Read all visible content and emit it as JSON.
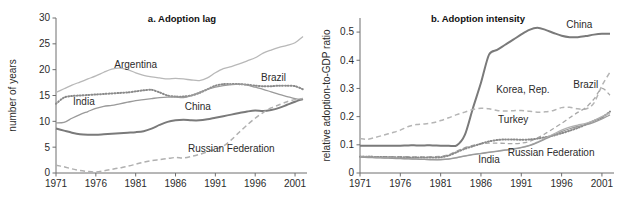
{
  "figure": {
    "width": 636,
    "height": 202,
    "background": "#ffffff"
  },
  "panel_a": {
    "title": "a. Adoption lag",
    "ylabel": "number of years"
  },
  "panel_b": {
    "title": "b. Adoption intensity",
    "ylabel": "relative adoption-to-GDP ratio"
  },
  "colors": {
    "china": "#7a7a7a",
    "argentina": "#b8b8b8",
    "brazil": "#9a9a9a",
    "india": "#8a8a8a",
    "russian_federation": "#b0b0b0",
    "korea_rep": "#b5b5b5",
    "turkey": "#a8a8a8",
    "axis": "#6e6e6e",
    "text": "#2b2b2b"
  },
  "chart_data": [
    {
      "id": "panel-a",
      "type": "line",
      "title": "a. Adoption lag",
      "xlabel": "",
      "ylabel": "number of years",
      "xlim": [
        1971,
        2002
      ],
      "ylim": [
        0,
        30
      ],
      "xticks": [
        1971,
        1976,
        1981,
        1986,
        1991,
        1996,
        2001
      ],
      "yticks": [
        0,
        5,
        10,
        15,
        20,
        25,
        30
      ],
      "grid": false,
      "legend": "inline-annotations",
      "x": [
        1971,
        1972,
        1973,
        1974,
        1975,
        1976,
        1977,
        1978,
        1979,
        1980,
        1981,
        1982,
        1983,
        1984,
        1985,
        1986,
        1987,
        1988,
        1989,
        1990,
        1991,
        1992,
        1993,
        1994,
        1995,
        1996,
        1997,
        1998,
        1999,
        2000,
        2001,
        2002
      ],
      "series": [
        {
          "name": "Argentina",
          "style": "solid",
          "color": "#b8b8b8",
          "label_x": 1981,
          "label_y": 20.3,
          "values": [
            15.6,
            16.3,
            17.0,
            17.6,
            18.2,
            18.8,
            19.5,
            20.1,
            20.3,
            20.0,
            19.4,
            18.9,
            18.6,
            18.4,
            18.2,
            18.3,
            18.2,
            18.0,
            17.9,
            18.4,
            19.4,
            20.2,
            20.6,
            21.1,
            21.7,
            22.3,
            23.2,
            23.8,
            24.3,
            24.7,
            25.2,
            26.4
          ]
        },
        {
          "name": "India",
          "style": "dotted",
          "color": "#8a8a8a",
          "label_x": 1974.5,
          "label_y": 13.1,
          "values": [
            13.4,
            14.6,
            14.9,
            15.0,
            15.1,
            15.2,
            15.3,
            15.4,
            15.5,
            15.6,
            15.8,
            16.0,
            16.1,
            15.6,
            15.0,
            14.8,
            14.8,
            15.0,
            15.5,
            16.2,
            16.9,
            17.2,
            17.2,
            17.2,
            17.1,
            16.9,
            16.8,
            16.8,
            16.9,
            16.9,
            16.8,
            16.2
          ]
        },
        {
          "name": "Brazil",
          "style": "solid",
          "color": "#9a9a9a",
          "label_x": 1998.3,
          "label_y": 17.8,
          "values": [
            9.7,
            9.8,
            10.6,
            11.3,
            11.9,
            12.5,
            12.9,
            13.1,
            13.4,
            13.7,
            14.0,
            14.2,
            14.4,
            14.6,
            14.7,
            14.7,
            14.6,
            15.0,
            15.6,
            16.2,
            16.6,
            16.9,
            17.1,
            17.2,
            17.0,
            16.6,
            16.2,
            15.7,
            15.2,
            14.8,
            14.4,
            14.2
          ]
        },
        {
          "name": "China",
          "style": "solid-thick",
          "color": "#7a7a7a",
          "label_x": 1988.8,
          "label_y": 12.2,
          "values": [
            8.6,
            8.2,
            7.8,
            7.5,
            7.4,
            7.4,
            7.5,
            7.6,
            7.7,
            7.8,
            7.9,
            8.1,
            8.6,
            9.3,
            9.9,
            10.2,
            10.3,
            10.2,
            10.2,
            10.4,
            10.7,
            11.0,
            11.3,
            11.6,
            11.9,
            12.1,
            12.0,
            12.2,
            12.6,
            13.2,
            13.8,
            14.3
          ]
        },
        {
          "name": "Russian Federation",
          "style": "dashed",
          "color": "#b0b0b0",
          "label_x": 1993.0,
          "label_y": 4.1,
          "values": [
            1.5,
            1.2,
            0.8,
            0.5,
            0.3,
            0.2,
            0.4,
            0.7,
            1.0,
            1.3,
            1.7,
            2.1,
            2.4,
            2.6,
            2.8,
            3.0,
            2.9,
            3.2,
            3.6,
            4.1,
            4.6,
            5.2,
            6.4,
            7.9,
            9.3,
            10.6,
            11.7,
            12.6,
            13.2,
            13.8,
            14.2,
            14.4
          ]
        }
      ]
    },
    {
      "id": "panel-b",
      "type": "line",
      "title": "b. Adoption intensity",
      "xlabel": "",
      "ylabel": "relative adoption-to-GDP ratio",
      "xlim": [
        1971,
        2002
      ],
      "ylim": [
        0,
        0.55
      ],
      "xticks": [
        1971,
        1976,
        1981,
        1986,
        1991,
        1996,
        2001
      ],
      "yticks": [
        0,
        0.1,
        0.2,
        0.3,
        0.4,
        0.5
      ],
      "ytick_labels": [
        "0",
        "0.1",
        "0.2",
        "0.3",
        "0.4",
        "0.5"
      ],
      "grid": false,
      "legend": "inline-annotations",
      "x": [
        1971,
        1972,
        1973,
        1974,
        1975,
        1976,
        1977,
        1978,
        1979,
        1980,
        1981,
        1982,
        1983,
        1984,
        1985,
        1986,
        1987,
        1988,
        1989,
        1990,
        1991,
        1992,
        1993,
        1994,
        1995,
        1996,
        1997,
        1998,
        1999,
        2000,
        2001,
        2002
      ],
      "series": [
        {
          "name": "China",
          "style": "solid-thick",
          "color": "#7a7a7a",
          "label_x": 1998.2,
          "label_y": 0.515,
          "values": [
            0.097,
            0.097,
            0.097,
            0.097,
            0.097,
            0.097,
            0.098,
            0.098,
            0.098,
            0.098,
            0.097,
            0.097,
            0.098,
            0.135,
            0.23,
            0.32,
            0.42,
            0.437,
            0.455,
            0.473,
            0.492,
            0.508,
            0.515,
            0.508,
            0.497,
            0.487,
            0.482,
            0.482,
            0.486,
            0.491,
            0.494,
            0.494
          ]
        },
        {
          "name": "Korea, Rep.",
          "style": "dashed",
          "color": "#b5b5b5",
          "label_x": 1991.2,
          "label_y": 0.283,
          "values": [
            0.122,
            0.12,
            0.127,
            0.135,
            0.143,
            0.152,
            0.165,
            0.172,
            0.174,
            0.178,
            0.186,
            0.196,
            0.207,
            0.216,
            0.225,
            0.23,
            0.228,
            0.222,
            0.22,
            0.221,
            0.222,
            0.219,
            0.216,
            0.217,
            0.222,
            0.232,
            0.233,
            0.228,
            0.227,
            0.248,
            0.31,
            0.358
          ]
        },
        {
          "name": "Turkey",
          "style": "dashed-light",
          "color": "#a8a8a8",
          "label_x": 1990.0,
          "label_y": 0.176,
          "values": [
            0.059,
            0.059,
            0.058,
            0.058,
            0.058,
            0.058,
            0.058,
            0.057,
            0.057,
            0.058,
            0.059,
            0.065,
            0.078,
            0.09,
            0.098,
            0.103,
            0.106,
            0.106,
            0.105,
            0.104,
            0.106,
            0.112,
            0.124,
            0.14,
            0.158,
            0.176,
            0.196,
            0.215,
            0.232,
            0.262,
            0.3,
            0.276
          ]
        },
        {
          "name": "India",
          "style": "dotted",
          "color": "#8a8a8a",
          "label_x": 1987.0,
          "label_y": 0.037,
          "values": [
            0.058,
            0.058,
            0.057,
            0.057,
            0.056,
            0.056,
            0.055,
            0.055,
            0.055,
            0.055,
            0.056,
            0.062,
            0.074,
            0.086,
            0.095,
            0.104,
            0.112,
            0.117,
            0.119,
            0.119,
            0.118,
            0.119,
            0.122,
            0.127,
            0.133,
            0.141,
            0.15,
            0.16,
            0.172,
            0.185,
            0.197,
            0.218
          ]
        },
        {
          "name": "Russian Federation",
          "style": "solid",
          "color": "#b0b0b0",
          "label_x": 1994.7,
          "label_y": 0.06,
          "values": [
            0.057,
            0.056,
            0.055,
            0.054,
            0.053,
            0.052,
            0.051,
            0.05,
            0.049,
            0.048,
            0.048,
            0.05,
            0.055,
            0.061,
            0.066,
            0.07,
            0.074,
            0.078,
            0.082,
            0.086,
            0.091,
            0.098,
            0.11,
            0.124,
            0.138,
            0.152,
            0.163,
            0.17,
            0.176,
            0.186,
            0.2,
            0.213
          ]
        },
        {
          "name": "Brazil",
          "style": "solid",
          "color": "#9a9a9a",
          "label_x": 1999.0,
          "label_y": 0.3,
          "values": [
            0.056,
            0.055,
            0.054,
            0.053,
            0.052,
            0.051,
            0.05,
            0.049,
            0.048,
            0.047,
            0.047,
            0.049,
            0.054,
            0.06,
            0.065,
            0.069,
            0.073,
            0.077,
            0.081,
            0.085,
            0.09,
            0.097,
            0.108,
            0.121,
            0.134,
            0.147,
            0.157,
            0.165,
            0.171,
            0.18,
            0.192,
            0.206
          ]
        }
      ]
    }
  ]
}
